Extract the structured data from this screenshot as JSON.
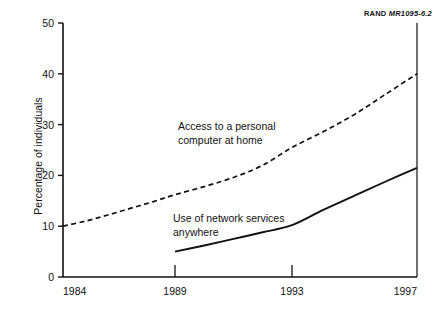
{
  "figure": {
    "source_label_prefix": "RAND ",
    "source_label_code": "MR1095-6.2"
  },
  "chart_data": {
    "type": "line",
    "title": "",
    "subtitle": "",
    "xlabel": "",
    "ylabel": "Percentage of individuals",
    "xlim": [
      1984,
      1997
    ],
    "ylim": [
      0,
      50
    ],
    "grid": false,
    "legend": "inline-annotations",
    "xticks": [
      1984,
      1989,
      1993,
      1997
    ],
    "xtick_labels": [
      "1984",
      "1989",
      "1993",
      "1997"
    ],
    "yticks": [
      0,
      10,
      20,
      30,
      40,
      50
    ],
    "ytick_labels": [
      "0",
      "10",
      "20",
      "30",
      "40",
      "50"
    ],
    "series": [
      {
        "name": "Access to a personal computer at home",
        "style": "dashed",
        "label_line_1": "Access to a personal",
        "label_line_2": "computer at home",
        "x": [
          1984,
          1985,
          1986,
          1987,
          1988,
          1989,
          1990,
          1991,
          1992,
          1993,
          1994,
          1995,
          1996,
          1997
        ],
        "values": [
          10.0,
          11.0,
          12.2,
          13.5,
          14.8,
          16.2,
          17.8,
          19.6,
          22.0,
          25.5,
          28.6,
          32.0,
          36.0,
          40.0
        ]
      },
      {
        "name": "Use of network services anywhere",
        "style": "solid",
        "label_line_1": "Use of network services",
        "label_line_2": "anywhere",
        "x": [
          1989,
          1990,
          1991,
          1992,
          1993,
          1994,
          1995,
          1996,
          1997
        ],
        "values": [
          5.0,
          6.2,
          7.5,
          8.8,
          10.2,
          13.2,
          16.0,
          18.8,
          21.5
        ]
      }
    ]
  }
}
